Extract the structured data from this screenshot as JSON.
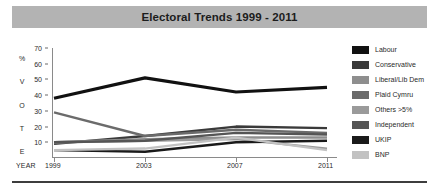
{
  "title": "Electoral Trends 1999 - 2011",
  "axis": {
    "y_label_chars": [
      "%",
      "V",
      "O",
      "T",
      "E"
    ],
    "x_title": "YEAR"
  },
  "legend": {
    "items": [
      {
        "label": "Labour",
        "color": "#111111"
      },
      {
        "label": "Conservative",
        "color": "#3a3a3a"
      },
      {
        "label": "Liberal/Lib Dem",
        "color": "#8e8e8e"
      },
      {
        "label": "Plaid Cymru",
        "color": "#6b6b6b"
      },
      {
        "label": "Others >5%",
        "color": "#9a9a9a"
      },
      {
        "label": "Independent",
        "color": "#555555"
      },
      {
        "label": "UKIP",
        "color": "#1a1a1a"
      },
      {
        "label": "BNP",
        "color": "#c2c2c2"
      }
    ]
  },
  "chart_data": {
    "type": "line",
    "title": "Electoral Trends 1999 - 2011",
    "xlabel": "YEAR",
    "ylabel": "% VOTE",
    "categories": [
      "1999",
      "2003",
      "2007",
      "2011"
    ],
    "x": [
      1999,
      2003,
      2007,
      2011
    ],
    "ylim": [
      0,
      70
    ],
    "yticks": [
      10,
      20,
      30,
      40,
      50,
      60,
      70
    ],
    "grid": false,
    "legend_position": "right",
    "series": [
      {
        "name": "Labour",
        "color": "#111111",
        "values": [
          38,
          51,
          42,
          45
        ]
      },
      {
        "name": "Conservative",
        "color": "#3a3a3a",
        "values": [
          9,
          14,
          20,
          19
        ]
      },
      {
        "name": "Plaid Cymru",
        "color": "#6b6b6b",
        "values": [
          29,
          14,
          18,
          16
        ]
      },
      {
        "name": "Liberal/Lib Dem",
        "color": "#8e8e8e",
        "values": [
          10,
          12,
          13,
          13
        ]
      },
      {
        "name": "Others >5%",
        "color": "#9a9a9a",
        "values": [
          10,
          11,
          12,
          6
        ]
      },
      {
        "name": "Independent",
        "color": "#555555",
        "values": [
          10,
          11,
          16,
          15
        ]
      },
      {
        "name": "UKIP",
        "color": "#1a1a1a",
        "values": [
          5,
          4,
          10,
          11
        ]
      },
      {
        "name": "BNP",
        "color": "#c2c2c2",
        "values": [
          5,
          6,
          13,
          5
        ]
      }
    ]
  }
}
